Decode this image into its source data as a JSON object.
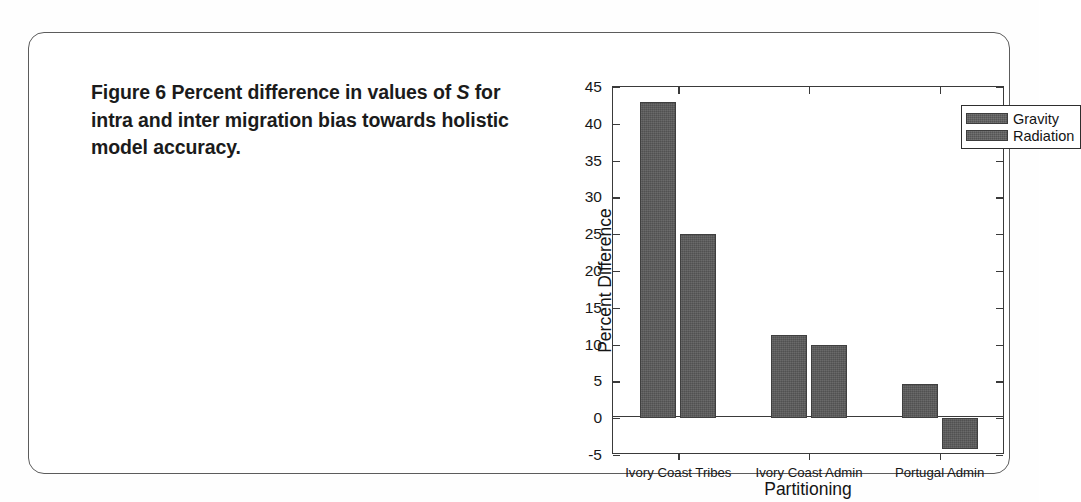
{
  "figure": {
    "caption_line1_pre": "Figure 6",
    "caption_line1_mid": "  Percent difference in values of ",
    "caption_italic": "S",
    "caption_rest": " for intra and inter migration bias towards holistic model accuracy."
  },
  "chart_data": {
    "type": "bar",
    "title": "",
    "xlabel": "Partitioning",
    "ylabel": "Percent Difference",
    "categories": [
      "Ivory Coast Tribes",
      "Ivory Coast Admin",
      "Portugal Admin"
    ],
    "series": [
      {
        "name": "Gravity",
        "values": [
          43.0,
          11.3,
          4.6
        ]
      },
      {
        "name": "Radiation",
        "values": [
          25.0,
          10.0,
          -4.2
        ]
      }
    ],
    "ylim": [
      -5,
      45
    ],
    "yticks": [
      -5,
      0,
      5,
      10,
      15,
      20,
      25,
      30,
      35,
      40,
      45
    ],
    "ytick_labels": [
      "-5",
      "0",
      "5",
      "10",
      "15",
      "20",
      "25",
      "30",
      "35",
      "40",
      "45"
    ],
    "grid": false,
    "legend_position": "top-right",
    "bar_color": "#595959",
    "axis_color": "#3a3a3a",
    "zero_line": 0
  }
}
